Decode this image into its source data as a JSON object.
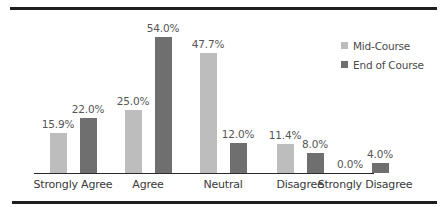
{
  "chart_data": {
    "type": "bar",
    "title": "",
    "xlabel": "",
    "ylabel": "",
    "categories": [
      "Strongly Agree",
      "Agree",
      "Neutral",
      "Disagree",
      "Strongly Disagree"
    ],
    "series": [
      {
        "name": "Mid-Course",
        "color": "#bdbdbd",
        "values": [
          15.9,
          25.0,
          47.7,
          11.4,
          0.0
        ],
        "labels": [
          "15.9%",
          "25.0%",
          "47.7%",
          "11.4%",
          "0.0%"
        ]
      },
      {
        "name": "End of Course",
        "color": "#6f6f6f",
        "values": [
          22.0,
          54.0,
          12.0,
          8.0,
          4.0
        ],
        "labels": [
          "22.0%",
          "54.0%",
          "12.0%",
          "8.0%",
          "4.0%"
        ]
      }
    ],
    "ylim": [
      0,
      60
    ],
    "grid": false,
    "legend_position": "upper right",
    "data_labels": true
  },
  "legend": {
    "items": [
      {
        "label": "Mid-Course",
        "color": "#bdbdbd"
      },
      {
        "label": "End of Course",
        "color": "#6f6f6f"
      }
    ]
  }
}
